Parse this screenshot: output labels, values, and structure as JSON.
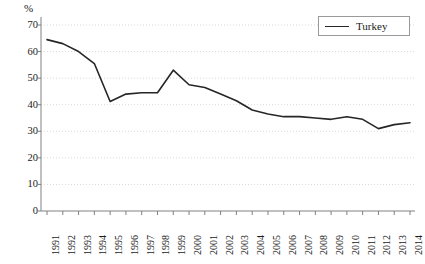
{
  "chart_data": {
    "type": "line",
    "title": "",
    "xlabel": "",
    "ylabel": "%",
    "ylim": [
      0,
      70
    ],
    "yticks": [
      0,
      10,
      20,
      30,
      40,
      50,
      60,
      70
    ],
    "grid": true,
    "legend_position": "top-right",
    "categories": [
      "1991",
      "1992",
      "1993",
      "1994",
      "1995",
      "1996",
      "1997",
      "1998",
      "1999",
      "2000",
      "2001",
      "2002",
      "2003",
      "2004",
      "2005",
      "2006",
      "2007",
      "2008",
      "2009",
      "2010",
      "2011",
      "2012",
      "2013",
      "2014"
    ],
    "series": [
      {
        "name": "Turkey",
        "color": "#262626",
        "values": [
          64.5,
          63.0,
          60.0,
          55.5,
          41.2,
          44.0,
          44.5,
          44.5,
          53.0,
          47.5,
          46.5,
          44.0,
          41.5,
          38.0,
          36.5,
          35.5,
          35.5,
          35.0,
          34.5,
          35.5,
          34.5,
          31.0,
          32.5,
          33.2
        ]
      }
    ]
  },
  "axes": {
    "y_unit_label": "%",
    "y_tick_labels": [
      "70",
      "60",
      "50",
      "40",
      "30",
      "20",
      "10",
      "0"
    ],
    "x_tick_labels": [
      "1991",
      "1992",
      "1993",
      "1994",
      "1995",
      "1996",
      "1997",
      "1998",
      "1999",
      "2000",
      "2001",
      "2002",
      "2003",
      "2004",
      "2005",
      "2006",
      "2007",
      "2008",
      "2009",
      "2010",
      "2011",
      "2012",
      "2013",
      "2014"
    ]
  },
  "legend": {
    "entries": [
      {
        "label": "Turkey",
        "color": "#262626"
      }
    ]
  },
  "style": {
    "grid_color": "#d9d9d9",
    "axis_color": "#808080",
    "line_color": "#262626",
    "background": "#ffffff"
  }
}
